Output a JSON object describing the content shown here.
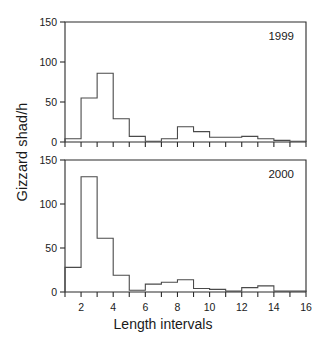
{
  "chart_data": {
    "type": "bar",
    "title": "",
    "xlabel": "Length intervals",
    "ylabel": "Gizzard shad/h",
    "xlim": [
      1,
      16
    ],
    "ylim": [
      0,
      150
    ],
    "grid": false,
    "legend": "none",
    "panels": [
      {
        "label": "1999",
        "yticks": [
          0,
          50,
          100,
          150
        ],
        "ytick_labels": [
          "0",
          "50",
          "100",
          "150"
        ],
        "bin_starts": [
          1,
          2,
          3,
          4,
          5,
          6,
          7,
          8,
          9,
          10,
          11,
          12,
          13,
          14,
          15
        ],
        "bin_width": 1,
        "values": [
          4,
          55,
          86,
          29,
          7,
          1,
          4,
          19,
          13,
          6,
          6,
          7,
          4,
          2,
          1
        ]
      },
      {
        "label": "2000",
        "yticks": [
          0,
          50,
          100,
          150
        ],
        "ytick_labels": [
          "0",
          "50",
          "100",
          "150"
        ],
        "bin_starts": [
          1,
          2,
          3,
          4,
          5,
          6,
          7,
          8,
          9,
          10,
          11,
          12,
          13,
          14,
          15
        ],
        "bin_width": 1,
        "values": [
          28,
          131,
          61,
          19,
          2,
          9,
          11,
          14,
          4,
          3,
          1,
          5,
          7,
          1,
          1
        ]
      }
    ],
    "xticks": [
      2,
      4,
      6,
      8,
      10,
      12,
      14,
      16
    ],
    "xtick_labels": [
      "2",
      "4",
      "6",
      "8",
      "10",
      "12",
      "14",
      "16"
    ],
    "xticks_minor": [
      1,
      3,
      5,
      7,
      9,
      11,
      13,
      15
    ]
  },
  "colors": {
    "axis": "#2b2b2b",
    "bar_stroke": "#4a4a4a",
    "background": "#ffffff",
    "text": "#1a1a1a"
  }
}
